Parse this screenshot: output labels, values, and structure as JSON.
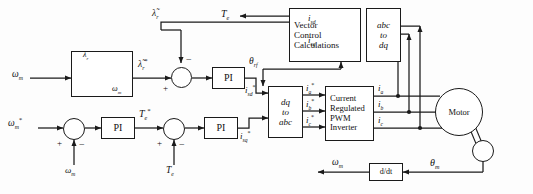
{
  "figure": {
    "kind": "control-block-diagram",
    "width": 533,
    "height": 194,
    "line_color": "#1a1a1a",
    "background": "#fdfdfd"
  },
  "blocks": {
    "flux_schedule": {
      "label": "",
      "axis_y": "λ",
      "axis_y_sub": "r",
      "axis_x": "ω",
      "axis_x_sub": "m",
      "note": "flux-weakening lookup curve"
    },
    "pi_flux": {
      "label": "PI"
    },
    "pi_speed": {
      "label": "PI"
    },
    "pi_torque": {
      "label": "PI"
    },
    "vector_control": {
      "line1": "Vector",
      "line2": "Control",
      "line3": "Calculations"
    },
    "abc_to_dq": {
      "line1": "abc",
      "line2": "to",
      "line3": "dq"
    },
    "dq_to_abc": {
      "line1": "dq",
      "line2": "to",
      "line3": "abc"
    },
    "inverter": {
      "line1": "Current",
      "line2": "Regulated",
      "line3": "PWM",
      "line4": "Inverter"
    },
    "motor": {
      "label": "Motor"
    },
    "derivative": {
      "label": "d/dt"
    },
    "encoder": {
      "label": ""
    }
  },
  "signals": {
    "omega_m_fb_left": {
      "base": "ω",
      "sub": "m",
      "star": false,
      "text": "ωm"
    },
    "omega_m_ref": {
      "base": "ω",
      "sub": "m",
      "star": true,
      "text": "ωm*"
    },
    "omega_m_feedback": {
      "base": "ω",
      "sub": "m",
      "star": false,
      "text": "ωm"
    },
    "omega_m_out": {
      "base": "ω",
      "sub": "m",
      "star": false,
      "text": "ωm"
    },
    "lambda_r_est": {
      "base": "λ",
      "sub": "r",
      "tilde": true,
      "text": "λ̃r"
    },
    "lambda_r_ref": {
      "base": "λ",
      "sub": "r",
      "tilde": true,
      "star": true,
      "text": "λ̃r*"
    },
    "Te_fb": {
      "base": "T",
      "sub": "e",
      "star": false,
      "text": "Te"
    },
    "Te_ref": {
      "base": "T",
      "sub": "e",
      "star": true,
      "text": "Te*"
    },
    "Te_feedback": {
      "base": "T",
      "sub": "e",
      "star": false,
      "text": "Te"
    },
    "isd_ref": {
      "base": "i",
      "sub": "sd",
      "star": true,
      "text": "isd*"
    },
    "isq_ref": {
      "base": "i",
      "sub": "sq",
      "star": true,
      "text": "isq*"
    },
    "isd_fb": {
      "base": "i",
      "sub": "sd",
      "star": false,
      "text": "isd"
    },
    "isq_fb": {
      "base": "i",
      "sub": "sq",
      "star": false,
      "text": "isq"
    },
    "ia_ref": {
      "base": "i",
      "sub": "a",
      "star": true,
      "text": "ia*"
    },
    "ib_ref": {
      "base": "i",
      "sub": "b",
      "star": true,
      "text": "ib*"
    },
    "ic_ref": {
      "base": "i",
      "sub": "c",
      "star": true,
      "text": "ic*"
    },
    "ia": {
      "base": "i",
      "sub": "a",
      "star": false,
      "text": "ia"
    },
    "ib": {
      "base": "i",
      "sub": "b",
      "star": false,
      "text": "ib"
    },
    "ic": {
      "base": "i",
      "sub": "c",
      "star": false,
      "text": "ic"
    },
    "theta_rf": {
      "base": "θ",
      "sub": "rf",
      "text": "θrf"
    },
    "theta_m": {
      "base": "θ",
      "sub": "m",
      "text": "θm"
    }
  },
  "sum_signs": {
    "flux_junction": {
      "plus": "+",
      "minus": "−"
    },
    "speed_junction": {
      "plus": "+",
      "minus": "−"
    },
    "torque_junction": {
      "plus": "+",
      "minus": "−"
    }
  }
}
